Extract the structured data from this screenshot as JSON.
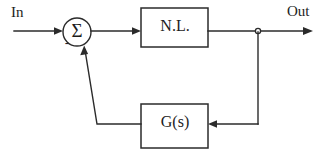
{
  "diagram": {
    "type": "block-diagram",
    "background_color": "#ffffff",
    "line_color": "#2b2b2b",
    "text_color": "#1d1d1d",
    "input": {
      "label": "In"
    },
    "output": {
      "label": "Out"
    },
    "summing_junction": {
      "symbol": "Σ",
      "negative_sign": "-",
      "center_x": 77,
      "center_y": 32,
      "radius": 14
    },
    "blocks": [
      {
        "id": "forward-block",
        "label": "N.L.",
        "x": 141,
        "y": 8,
        "width": 67,
        "height": 39
      },
      {
        "id": "feedback-block",
        "label": "G(s)",
        "x": 141,
        "y": 104,
        "width": 67,
        "height": 44
      }
    ],
    "junction_node": {
      "x": 258,
      "y": 31,
      "radius": 2.6
    },
    "signal_flow": [
      "In -> summing junction",
      "summing junction -> N.L.",
      "N.L. -> Out",
      "N.L. output tap -> G(s)",
      "G(s) -> summing junction (negative)"
    ]
  }
}
